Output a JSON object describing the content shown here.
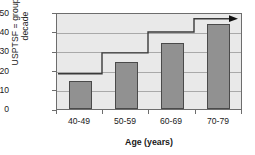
{
  "chart_data": {
    "type": "bar",
    "title": "",
    "subtitle": "",
    "xlabel": "Age (years)",
    "ylabel": "USPTSF = group by decade",
    "ylabel_line1": "USPTSF = group by",
    "ylabel_line2": "decade",
    "categories": [
      "40-49",
      "50-59",
      "60-69",
      "70-79"
    ],
    "values": [
      14.5,
      24.5,
      34.5,
      44.5
    ],
    "ylim": [
      0,
      50
    ],
    "ytick_labels": [
      "0",
      "10",
      "20",
      "30",
      "40",
      "50"
    ],
    "ytick_values": [
      0,
      10,
      20,
      30,
      40,
      50
    ],
    "grid": true,
    "legend": "none",
    "series": [
      {
        "name": "USPTSF = group by decade",
        "type": "bar",
        "values": [
          14.5,
          24.5,
          34.5,
          44.5
        ],
        "color": "#919191",
        "border_color": "#4a4a4a"
      },
      {
        "name": "step-threshold",
        "type": "step",
        "values": [
          18,
          29,
          40,
          47
        ],
        "color": "#3a3a3a",
        "arrow": "right",
        "annotation": "arrow at right end of step line"
      }
    ],
    "annotations": [
      {
        "name": "right-arrow",
        "at_category": "70-79",
        "value": 47,
        "direction": "right"
      }
    ],
    "plot_background": "#e9e9e9",
    "grid_color": "#a9a9a9",
    "axis_color": "#6d6d6d"
  }
}
